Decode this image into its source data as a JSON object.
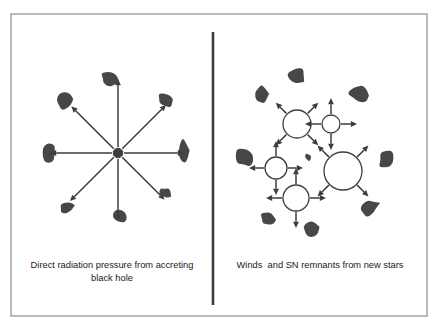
{
  "figure": {
    "type": "diagram",
    "background_color": "#ffffff",
    "frame": {
      "x": 11,
      "y": 14,
      "width": 416,
      "height": 302,
      "stroke_color": "#8c8c8c",
      "stroke_width": 1.2
    },
    "divider": {
      "x": 213,
      "y1": 32,
      "y2": 305,
      "stroke_color": "#3d3d3d",
      "stroke_width": 2.6
    },
    "colors": {
      "cloud_fill": "#474747",
      "arrow": "#3d3d3d",
      "bubble_stroke": "#3d3d3d",
      "bubble_fill": "#ffffff",
      "frame": "#8c8c8c",
      "text": "#1a1a1a"
    }
  },
  "panels": [
    {
      "id": "left-panel",
      "name": "direct-radiation-pressure-panel",
      "caption_lines": [
        "Direct radiation pressure from accreting",
        "black hole"
      ],
      "caption_full": "Direct radiation pressure from accreting black hole",
      "caption_x": 112,
      "caption_y": 268,
      "caption_line_height": 13,
      "source": {
        "name": "black-hole-core",
        "cx": 118,
        "cy": 153,
        "r": 5,
        "shape": "octagon",
        "fill": "#3d3d3d"
      },
      "rays": {
        "count": 8,
        "inner_radius": 6,
        "description": "eight radial arrows pointing outward from the central accreting black hole",
        "items": [
          {
            "name": "ray-up",
            "angle_deg": 270,
            "length": 68
          },
          {
            "name": "ray-up-right",
            "angle_deg": 315,
            "length": 62
          },
          {
            "name": "ray-right",
            "angle_deg": 0,
            "length": 60
          },
          {
            "name": "ray-down-right",
            "angle_deg": 45,
            "length": 60
          },
          {
            "name": "ray-down",
            "angle_deg": 90,
            "length": 62
          },
          {
            "name": "ray-down-left",
            "angle_deg": 135,
            "length": 62
          },
          {
            "name": "ray-left",
            "angle_deg": 180,
            "length": 62
          },
          {
            "name": "ray-up-left",
            "angle_deg": 225,
            "length": 60
          }
        ]
      },
      "clouds": [
        {
          "name": "cloud-top",
          "cx": 110,
          "cy": 79,
          "rx": 10,
          "ry": 7,
          "rot": 18,
          "seed": 1
        },
        {
          "name": "cloud-upper-left",
          "cx": 65,
          "cy": 101,
          "rx": 10,
          "ry": 10,
          "rot": -12,
          "seed": 2
        },
        {
          "name": "cloud-upper-right",
          "cx": 166,
          "cy": 100,
          "rx": 9,
          "ry": 7,
          "rot": 25,
          "seed": 3
        },
        {
          "name": "cloud-left",
          "cx": 49,
          "cy": 152,
          "rx": 8,
          "ry": 12,
          "rot": 8,
          "seed": 4
        },
        {
          "name": "cloud-right",
          "cx": 183,
          "cy": 151,
          "rx": 6,
          "ry": 12,
          "rot": -6,
          "seed": 5
        },
        {
          "name": "cloud-lower-right",
          "cx": 165,
          "cy": 193,
          "rx": 7,
          "ry": 6,
          "rot": 30,
          "seed": 6
        },
        {
          "name": "cloud-lower-left",
          "cx": 67,
          "cy": 208,
          "rx": 9,
          "ry": 6,
          "rot": -20,
          "seed": 7
        },
        {
          "name": "cloud-bottom",
          "cx": 120,
          "cy": 216,
          "rx": 8,
          "ry": 7,
          "rot": 10,
          "seed": 8
        }
      ]
    },
    {
      "id": "right-panel",
      "name": "stellar-feedback-panel",
      "caption_lines": [
        "Winds  and SN remnants from new stars"
      ],
      "caption_full": "Winds  and SN remnants from new stars",
      "caption_x": 320,
      "caption_y": 268,
      "caption_line_height": 13,
      "bubbles": [
        {
          "name": "wind-bubble-upper-left",
          "cx": 297,
          "cy": 124,
          "r": 14,
          "arrow_style": "diagonal",
          "arrow_length": 15,
          "angles_deg": [
            225,
            315,
            45,
            135
          ]
        },
        {
          "name": "wind-bubble-upper-right",
          "cx": 331,
          "cy": 124,
          "r": 9,
          "arrow_style": "cardinal",
          "arrow_length": 16,
          "angles_deg": [
            270,
            0,
            90,
            180
          ]
        },
        {
          "name": "wind-bubble-large-right",
          "cx": 343,
          "cy": 171,
          "r": 19,
          "arrow_style": "diagonal",
          "arrow_length": 16,
          "angles_deg": [
            225,
            315,
            45,
            135
          ]
        },
        {
          "name": "wind-bubble-mid-left",
          "cx": 276,
          "cy": 168,
          "r": 11,
          "arrow_style": "cardinal",
          "arrow_length": 15,
          "angles_deg": [
            270,
            0,
            90,
            180
          ]
        },
        {
          "name": "wind-bubble-lower-left",
          "cx": 296,
          "cy": 198,
          "r": 13,
          "arrow_style": "cardinal",
          "arrow_length": 16,
          "angles_deg": [
            270,
            0,
            90,
            180
          ]
        }
      ],
      "clouds": [
        {
          "name": "cloud-top",
          "cx": 296,
          "cy": 76,
          "rx": 9,
          "ry": 10,
          "rot": 35,
          "seed": 11
        },
        {
          "name": "cloud-upper-left",
          "cx": 262,
          "cy": 95,
          "rx": 7,
          "ry": 11,
          "rot": -10,
          "seed": 12
        },
        {
          "name": "cloud-upper-right",
          "cx": 359,
          "cy": 93,
          "rx": 11,
          "ry": 10,
          "rot": 15,
          "seed": 13
        },
        {
          "name": "cloud-left",
          "cx": 245,
          "cy": 157,
          "rx": 9,
          "ry": 11,
          "rot": -18,
          "seed": 14
        },
        {
          "name": "cloud-inner-small",
          "cx": 308,
          "cy": 157,
          "rx": 4,
          "ry": 4,
          "rot": 0,
          "seed": 15
        },
        {
          "name": "cloud-right",
          "cx": 387,
          "cy": 160,
          "rx": 9,
          "ry": 10,
          "rot": 22,
          "seed": 16
        },
        {
          "name": "cloud-lower-right",
          "cx": 369,
          "cy": 208,
          "rx": 11,
          "ry": 8,
          "rot": -25,
          "seed": 17
        },
        {
          "name": "cloud-lower-left",
          "cx": 268,
          "cy": 218,
          "rx": 8,
          "ry": 7,
          "rot": 12,
          "seed": 18
        },
        {
          "name": "cloud-bottom",
          "cx": 311,
          "cy": 228,
          "rx": 9,
          "ry": 9,
          "rot": -8,
          "seed": 19
        }
      ]
    }
  ],
  "chart_data": {
    "type": "diagram",
    "title": "",
    "panel_labels": [
      "Direct radiation pressure from accreting black hole",
      "Winds  and SN remnants from new stars"
    ],
    "left_panel_elements": {
      "central_source": "accreting black hole",
      "radial_arrows": 8,
      "gas_clouds": 8
    },
    "right_panel_elements": {
      "wind_bubbles": 5,
      "arrows_per_bubble": 4,
      "gas_clouds": 9
    }
  }
}
